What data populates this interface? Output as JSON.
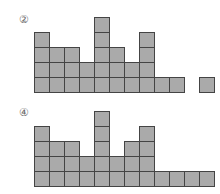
{
  "panels": [
    {
      "label": "②",
      "column_heights": [
        4,
        3,
        3,
        2,
        5,
        3,
        2,
        4,
        1,
        1,
        0,
        1
      ]
    },
    {
      "label": "④",
      "column_heights": [
        4,
        3,
        3,
        2,
        5,
        2,
        3,
        4,
        1,
        1,
        1,
        1
      ]
    }
  ],
  "colors": {
    "cell_fill": "#aaaaaa",
    "cell_border": "#444444"
  }
}
